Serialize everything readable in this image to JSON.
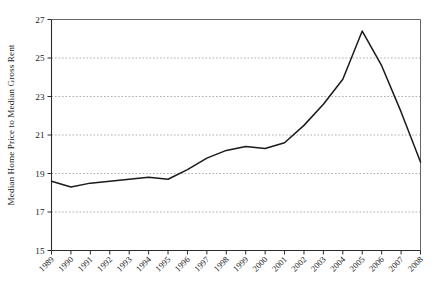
{
  "chart_data": {
    "type": "line",
    "title": "",
    "xlabel": "",
    "ylabel": "Median Home Price to Median Gross Rent",
    "categories": [
      "1989",
      "1990",
      "1991",
      "1992",
      "1993",
      "1994",
      "1995",
      "1996",
      "1997",
      "1998",
      "1999",
      "2000",
      "2001",
      "2002",
      "2003",
      "2004",
      "2005",
      "2006",
      "2007",
      "2008"
    ],
    "x": [
      1989,
      1990,
      1991,
      1992,
      1993,
      1994,
      1995,
      1996,
      1997,
      1998,
      1999,
      2000,
      2001,
      2002,
      2003,
      2004,
      2005,
      2006,
      2007,
      2008
    ],
    "values": [
      18.6,
      18.3,
      18.5,
      18.6,
      18.7,
      18.8,
      18.7,
      19.2,
      19.8,
      20.2,
      20.4,
      20.3,
      20.6,
      21.5,
      22.6,
      23.9,
      26.4,
      24.6,
      22.2,
      19.6
    ],
    "series": [
      {
        "name": "Median Home Price to Median Gross Rent",
        "values": [
          18.6,
          18.3,
          18.5,
          18.6,
          18.7,
          18.8,
          18.7,
          19.2,
          19.8,
          20.2,
          20.4,
          20.3,
          20.6,
          21.5,
          22.6,
          23.9,
          26.4,
          24.6,
          22.2,
          19.6
        ]
      }
    ],
    "ylim": [
      15,
      27
    ],
    "yticks": [
      15,
      17,
      19,
      21,
      23,
      25,
      27
    ],
    "ytick_labels": [
      "15",
      "17",
      "19",
      "21",
      "23",
      "25",
      "27"
    ],
    "xlim": [
      1989,
      2008
    ],
    "grid": "horizontal-dotted",
    "legend": "none",
    "line_color": "#1a1a1a"
  }
}
